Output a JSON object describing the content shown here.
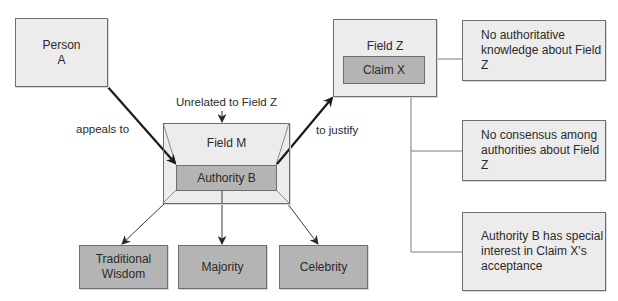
{
  "nodes": {
    "person_a": {
      "label": "Person A",
      "line1": "Person",
      "line2": "A"
    },
    "field_m": {
      "label": "Field M"
    },
    "authority_b": {
      "label": "Authority B"
    },
    "field_z": {
      "label": "Field Z"
    },
    "claim_x": {
      "label": "Claim X"
    },
    "traditional_wisdom": {
      "line1": "Traditional",
      "line2": "Wisdom"
    },
    "majority": {
      "label": "Majority"
    },
    "celebrity": {
      "label": "Celebrity"
    }
  },
  "conditions": [
    {
      "line1": "No authoritative",
      "line2": "knowledge about Field Z"
    },
    {
      "line1": "No consensus among",
      "line2": "authorities about Field Z"
    },
    {
      "line1": "Authority B has special",
      "line2": "interest in Claim X's",
      "line3": "acceptance"
    }
  ],
  "edge_labels": {
    "appeals_to": "appeals to",
    "unrelated": "Unrelated to Field Z",
    "to_justify": "to justify"
  },
  "colors": {
    "light_fill": "#ececec",
    "dark_fill": "#b4b4b4",
    "border": "#6e6e6e",
    "arrow": "#1a1a1a"
  }
}
